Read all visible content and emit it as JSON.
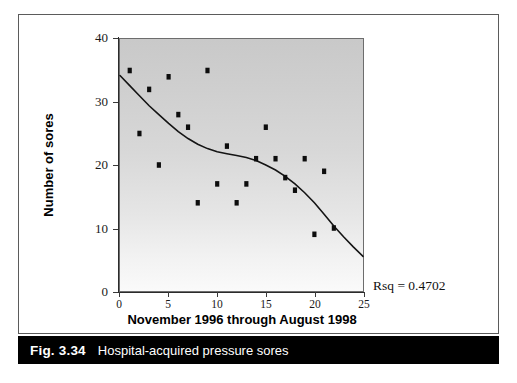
{
  "figure": {
    "caption_number": "Fig. 3.34",
    "caption_text": "Hospital-acquired pressure sores",
    "frame_color": "#5b5b5b",
    "caption_bar_color": "#000000",
    "caption_text_color": "#ffffff"
  },
  "chart_data": {
    "type": "scatter",
    "title": "Hospital-acquired pressure sores",
    "xlabel": "November 1996 through August 1998",
    "ylabel": "Number of sores",
    "xlim": [
      0,
      25
    ],
    "ylim": [
      0,
      40
    ],
    "xticks": [
      0,
      5,
      10,
      15,
      20,
      25
    ],
    "yticks": [
      0,
      10,
      20,
      30,
      40
    ],
    "xtick_labels": [
      "0",
      "5",
      "10",
      "15",
      "20",
      "25"
    ],
    "ytick_labels": [
      "0",
      "10",
      "20",
      "30",
      "40"
    ],
    "grid": false,
    "legend": null,
    "plot_background": "vertical gradient from grey #c9c9c9 at top to near-white #fafafa at bottom",
    "marker_color": "#0d0d0d",
    "marker_shape": "square",
    "annotations": [
      {
        "name": "rsq",
        "text": "Rsq = 0.4702",
        "value": 0.4702
      }
    ],
    "series": [
      {
        "name": "Number of sores",
        "type": "scatter",
        "points": [
          [
            1,
            35
          ],
          [
            2,
            25
          ],
          [
            3,
            32
          ],
          [
            4,
            20
          ],
          [
            5,
            34
          ],
          [
            6,
            28
          ],
          [
            7,
            26
          ],
          [
            8,
            14
          ],
          [
            9,
            35
          ],
          [
            10,
            17
          ],
          [
            11,
            23
          ],
          [
            12,
            14
          ],
          [
            13,
            17
          ],
          [
            14,
            21
          ],
          [
            15,
            26
          ],
          [
            16,
            21
          ],
          [
            17,
            18
          ],
          [
            18,
            16
          ],
          [
            19,
            21
          ],
          [
            20,
            9
          ],
          [
            21,
            19
          ],
          [
            22,
            10
          ]
        ]
      },
      {
        "name": "Fitted cubic trend curve",
        "type": "line",
        "points": [
          [
            0,
            34.2
          ],
          [
            1,
            32.6
          ],
          [
            2,
            31.0
          ],
          [
            3,
            29.4
          ],
          [
            4,
            28.0
          ],
          [
            5,
            26.6
          ],
          [
            6,
            25.3
          ],
          [
            7,
            24.2
          ],
          [
            8,
            23.3
          ],
          [
            9,
            22.6
          ],
          [
            10,
            22.1
          ],
          [
            11,
            21.8
          ],
          [
            12,
            21.5
          ],
          [
            13,
            21.2
          ],
          [
            14,
            20.7
          ],
          [
            15,
            20.0
          ],
          [
            16,
            19.2
          ],
          [
            17,
            18.2
          ],
          [
            18,
            17.0
          ],
          [
            19,
            15.6
          ],
          [
            20,
            14.0
          ],
          [
            21,
            12.2
          ],
          [
            22,
            10.3
          ],
          [
            23,
            8.6
          ],
          [
            24,
            7.0
          ],
          [
            25,
            5.5
          ]
        ]
      }
    ]
  }
}
